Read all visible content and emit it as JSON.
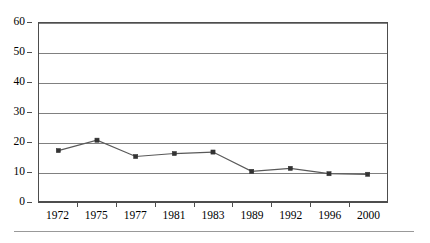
{
  "chart_data": {
    "type": "line",
    "title": "",
    "subtitle": "",
    "xlabel": "",
    "ylabel": "",
    "categories": [
      "1972",
      "1975",
      "1977",
      "1981",
      "1983",
      "1989",
      "1992",
      "1996",
      "2000"
    ],
    "values": [
      17,
      20.5,
      15,
      16,
      16.5,
      10,
      11,
      9.2,
      9
    ],
    "series": [
      {
        "name": "",
        "values": [
          17,
          20.5,
          15,
          16,
          16.5,
          10,
          11,
          9.2,
          9
        ]
      }
    ],
    "ylim": [
      0,
      60
    ],
    "ytick_labels": [
      "60",
      "50",
      "40",
      "30",
      "20",
      "10",
      "0"
    ],
    "ytick_values": [
      60,
      50,
      40,
      30,
      20,
      10,
      0
    ],
    "ystep": 10,
    "grid": true,
    "grid_axis": "y",
    "legend": false,
    "legend_position": "none",
    "marker": "square",
    "colors": {
      "line": "#595959",
      "marker": "#333333",
      "gridline": "#808080",
      "frame": "#4d4d4d",
      "background": "#ffffff",
      "footer_rule": "#999999"
    },
    "annotations": []
  }
}
